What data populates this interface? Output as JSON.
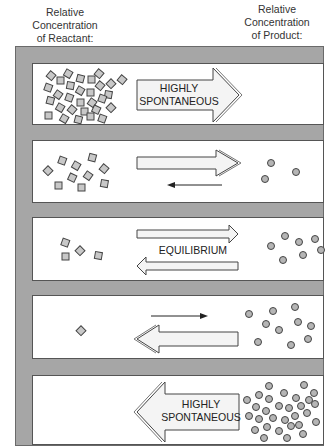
{
  "headers": {
    "reactant": "Relative\nConcentration\nof Reactant:",
    "reactant_lines": [
      "Relative",
      "Concentration",
      "of Reactant:"
    ],
    "product_lines": [
      "Relative",
      "Concentration",
      "of Product:"
    ]
  },
  "panels": [
    {
      "id": "highly-spontaneous-forward",
      "label_lines": [
        "HIGHLY",
        "SPONTANEOUS"
      ],
      "reactant_count": 30,
      "product_count": 0,
      "forward_arrow": "large",
      "reverse_arrow": "none"
    },
    {
      "id": "favors-products",
      "label_lines": [],
      "reactant_count": 11,
      "product_count": 3,
      "forward_arrow": "large",
      "reverse_arrow": "thin"
    },
    {
      "id": "equilibrium",
      "label_lines": [
        "EQUILIBRIUM"
      ],
      "reactant_count": 4,
      "product_count": 8,
      "forward_arrow": "medium",
      "reverse_arrow": "medium"
    },
    {
      "id": "favors-reactants",
      "label_lines": [],
      "reactant_count": 1,
      "product_count": 11,
      "forward_arrow": "thin",
      "reverse_arrow": "large"
    },
    {
      "id": "highly-spontaneous-reverse",
      "label_lines": [
        "HIGHLY",
        "SPONTANEOUS"
      ],
      "reactant_count": 0,
      "product_count": 30,
      "forward_arrow": "none",
      "reverse_arrow": "large"
    }
  ],
  "colors": {
    "frame": "#a6a6a6",
    "particle_fill": "#c8c8c8",
    "particle_stroke": "#444444",
    "arrow_fill": "#f4f4f4"
  }
}
